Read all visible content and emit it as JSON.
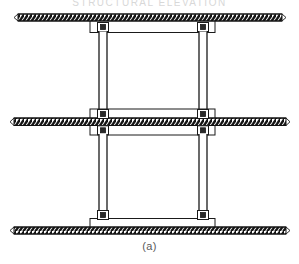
{
  "figure": {
    "caption": "(a)",
    "cropped_header_text": "STRUCTURAL ELEVATION",
    "type": "structural-elevation-diagram",
    "colors": {
      "background": "#ffffff",
      "line": "#1a1a1a",
      "hatch": "#111111",
      "slab_fill": "#ffffff",
      "caption_text": "#5a5a5a",
      "header_text": "#d8d8d8"
    },
    "slabs": [
      {
        "name": "roof-slab",
        "label": "Roof slab",
        "x": 18,
        "y": 14,
        "width": 264,
        "height": 7
      },
      {
        "name": "floor-slab",
        "label": "Floor slab",
        "x": 14,
        "y": 118,
        "width": 272,
        "height": 7
      },
      {
        "name": "base-slab",
        "label": "Base slab",
        "x": 14,
        "y": 227,
        "width": 272,
        "height": 7
      }
    ],
    "blocks": [
      {
        "name": "roof-beam-block",
        "label": "Roof beam block",
        "x": 90,
        "y": 21,
        "width": 125,
        "height": 11
      },
      {
        "name": "floor-beam-block",
        "label": "Floor beam block",
        "x": 90,
        "y": 109,
        "width": 125,
        "height": 25
      },
      {
        "name": "base-beam-block",
        "label": "Base beam block",
        "x": 90,
        "y": 219,
        "width": 125,
        "height": 9
      }
    ],
    "columns": [
      {
        "name": "column-upper-left",
        "label": "Upper left column",
        "x": 99,
        "y_top": 32,
        "y_bottom": 109,
        "width": 8
      },
      {
        "name": "column-upper-right",
        "label": "Upper right column",
        "x": 199,
        "y_top": 32,
        "y_bottom": 109,
        "width": 8
      },
      {
        "name": "column-lower-left",
        "label": "Lower left column",
        "x": 99,
        "y_top": 134,
        "y_bottom": 219,
        "width": 8
      },
      {
        "name": "column-lower-right",
        "label": "Lower right column",
        "x": 199,
        "y_top": 134,
        "y_bottom": 219,
        "width": 8
      }
    ],
    "joints": [
      {
        "name": "joint-roof-left",
        "label": "Roof left joint",
        "x": 99,
        "y": 24
      },
      {
        "name": "joint-roof-right",
        "label": "Roof right joint",
        "x": 199,
        "y": 24
      },
      {
        "name": "joint-floor-left-upper",
        "label": "Floor left upper joint",
        "x": 99,
        "y": 111
      },
      {
        "name": "joint-floor-right-upper",
        "label": "Floor right upper joint",
        "x": 199,
        "y": 111
      },
      {
        "name": "joint-floor-left-lower",
        "label": "Floor left lower joint",
        "x": 99,
        "y": 128
      },
      {
        "name": "joint-floor-right-lower",
        "label": "Floor right lower joint",
        "x": 199,
        "y": 128
      },
      {
        "name": "joint-base-left",
        "label": "Base left joint",
        "x": 99,
        "y": 212
      },
      {
        "name": "joint-base-right",
        "label": "Base right joint",
        "x": 199,
        "y": 212
      }
    ],
    "stories": [
      {
        "name": "upper-story",
        "label": "Upper story",
        "clear_height_px": 77
      },
      {
        "name": "lower-story",
        "label": "Lower story",
        "clear_height_px": 85
      }
    ]
  }
}
